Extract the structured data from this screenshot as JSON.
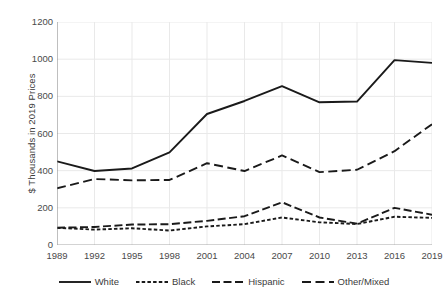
{
  "chart_data": {
    "type": "line",
    "title": "",
    "xlabel": "",
    "ylabel": "$ Thousands in 2019 Prices",
    "x": [
      1989,
      1992,
      1995,
      1998,
      2001,
      2004,
      2007,
      2010,
      2013,
      2016,
      2019
    ],
    "xticklabels": [
      "1989",
      "1992",
      "1995",
      "1998",
      "2001",
      "2004",
      "2007",
      "2010",
      "2013",
      "2016",
      "2019"
    ],
    "yticklabels": [
      "0",
      "200",
      "400",
      "600",
      "800",
      "1000",
      "1200"
    ],
    "ylim": [
      0,
      1200
    ],
    "xlim": [
      1989,
      2019
    ],
    "ytick_values": [
      0,
      200,
      400,
      600,
      800,
      1000,
      1200
    ],
    "grid": "both",
    "legend_position": "bottom",
    "series": [
      {
        "name": "White",
        "style": "solid",
        "color": "#1a1a1a",
        "values": [
          450,
          398,
          412,
          498,
          705,
          775,
          855,
          768,
          772,
          995,
          980
        ]
      },
      {
        "name": "Black",
        "style": "dotted",
        "color": "#1a1a1a",
        "values": [
          92,
          83,
          90,
          78,
          100,
          112,
          148,
          122,
          113,
          152,
          146
        ]
      },
      {
        "name": "Hispanic",
        "style": "dashed",
        "color": "#1a1a1a",
        "values": [
          93,
          97,
          110,
          112,
          130,
          155,
          230,
          148,
          115,
          200,
          163
        ]
      },
      {
        "name": "Other/Mixed",
        "style": "longdash",
        "color": "#1a1a1a",
        "values": [
          305,
          355,
          348,
          350,
          440,
          398,
          482,
          392,
          405,
          505,
          650
        ]
      }
    ]
  },
  "legend": {
    "items": [
      {
        "label": "White"
      },
      {
        "label": "Black"
      },
      {
        "label": "Hispanic"
      },
      {
        "label": "Other/Mixed"
      }
    ]
  }
}
